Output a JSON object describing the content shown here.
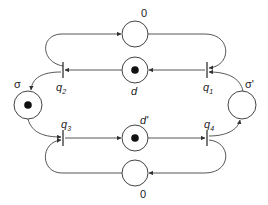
{
  "diagram": {
    "type": "petri-net",
    "places": [
      {
        "id": "top0",
        "label": "0",
        "tokens": 0
      },
      {
        "id": "d",
        "label": "d",
        "tokens": 1
      },
      {
        "id": "dprime",
        "label": "d'",
        "tokens": 1
      },
      {
        "id": "bottom0",
        "label": "0",
        "tokens": 0
      },
      {
        "id": "sigma",
        "label": "σ",
        "tokens": 1
      },
      {
        "id": "sigmaprime",
        "label": "σ'",
        "tokens": 0
      }
    ],
    "transitions": [
      {
        "id": "q1",
        "label": "q",
        "sub": "1"
      },
      {
        "id": "q2",
        "label": "q",
        "sub": "2"
      },
      {
        "id": "q3",
        "label": "q",
        "sub": "3"
      },
      {
        "id": "q4",
        "label": "q",
        "sub": "4"
      }
    ],
    "arcs": [
      {
        "from": "q2",
        "to": "top0"
      },
      {
        "from": "top0",
        "to": "q1"
      },
      {
        "from": "q1",
        "to": "d"
      },
      {
        "from": "d",
        "to": "q2"
      },
      {
        "from": "q2",
        "to": "sigma"
      },
      {
        "from": "sigma",
        "to": "q3"
      },
      {
        "from": "q3",
        "to": "dprime"
      },
      {
        "from": "dprime",
        "to": "q4"
      },
      {
        "from": "q4",
        "to": "sigmaprime"
      },
      {
        "from": "sigmaprime",
        "to": "q1"
      },
      {
        "from": "q4",
        "to": "bottom0"
      },
      {
        "from": "bottom0",
        "to": "q3"
      }
    ]
  }
}
